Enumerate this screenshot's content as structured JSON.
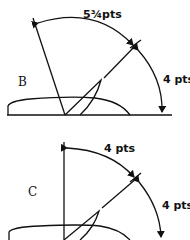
{
  "figures": [
    {
      "id": "B",
      "label": "B",
      "angles": [
        {
          "label": "5¾pts",
          "value": "5¾ pts"
        },
        {
          "label": "4 pts",
          "value": "4 pts"
        }
      ]
    },
    {
      "id": "C",
      "label": "C",
      "angles": [
        {
          "label": "4 pts",
          "value": "4 pts"
        },
        {
          "label": "4 pts",
          "value": "4 pts"
        }
      ]
    }
  ]
}
